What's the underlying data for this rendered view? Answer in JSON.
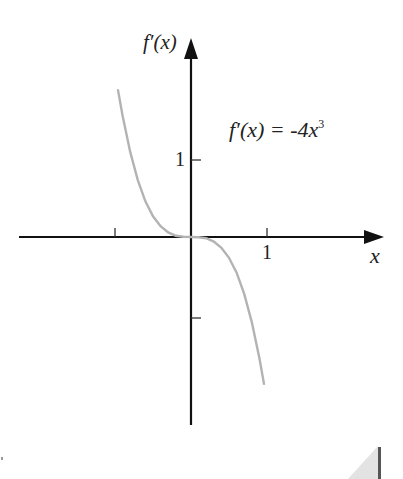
{
  "chart_data": {
    "type": "line",
    "title": "",
    "function": "f'(x) = -4x^3",
    "legend": [
      "f'(x) = -4x³"
    ],
    "xlabel": "x",
    "ylabel": "f'(x)",
    "x_ticks": [
      -1,
      1
    ],
    "x_tick_labels": [
      "",
      "1"
    ],
    "y_ticks": [
      1,
      -1
    ],
    "y_tick_labels": [
      "1",
      ""
    ],
    "xlim": [
      -2.27,
      2.53
    ],
    "ylim": [
      -2.4,
      2.57
    ],
    "grid": false,
    "series": [
      {
        "name": "f'(x) = -4x^3",
        "color": "#b3b3b3",
        "x": [
          -0.96,
          -0.9,
          -0.8,
          -0.7,
          -0.6,
          -0.5,
          -0.4,
          -0.3,
          -0.2,
          -0.1,
          0,
          0.1,
          0.2,
          0.3,
          0.4,
          0.5,
          0.6,
          0.7,
          0.8,
          0.9,
          0.96
        ],
        "y": [
          3.54,
          2.92,
          2.05,
          1.37,
          0.86,
          0.5,
          0.26,
          0.11,
          0.03,
          0.004,
          0,
          -0.004,
          -0.03,
          -0.11,
          -0.26,
          -0.5,
          -0.86,
          -1.37,
          -2.05,
          -2.92,
          -3.54
        ]
      }
    ],
    "annotations": [
      {
        "text": "f'(x) = -4x³",
        "position": "upper-right"
      }
    ]
  },
  "labels": {
    "y_axis": "f′(x)",
    "x_axis": "x",
    "formula_main": "f′(x) = -4x",
    "formula_exp": "3",
    "tick_y1": "1",
    "tick_x1": "1"
  },
  "colors": {
    "axis": "#111111",
    "curve": "#b3b3b3",
    "text": "#222222",
    "background": "#ffffff"
  }
}
